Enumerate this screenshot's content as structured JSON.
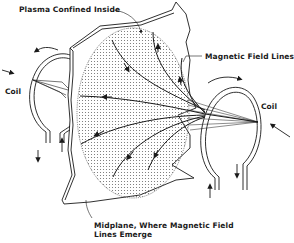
{
  "diagram": {
    "labels": {
      "plasma": "Plasma Confined Inside",
      "field_lines": "Magnetic Field Lines",
      "coil_left": "Coil",
      "coil_right": "Coil",
      "midplane_line1": "Midplane, Where Magnetic Field",
      "midplane_line2": "Lines Emerge"
    },
    "colors": {
      "ink": "#1a1a1a",
      "plasma_dots": "#6a6a6a",
      "background": "#ffffff"
    }
  }
}
